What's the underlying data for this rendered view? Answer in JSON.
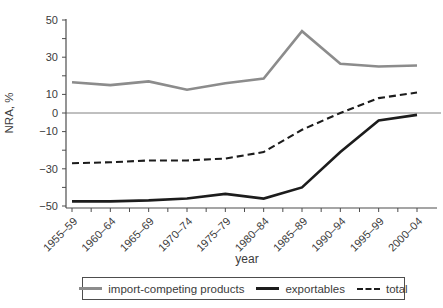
{
  "chart_data": {
    "type": "line",
    "title": "",
    "xlabel": "year",
    "ylabel": "NRA, %",
    "categories": [
      "1955–59",
      "1960–64",
      "1965–69",
      "1970–74",
      "1975–79",
      "1980–84",
      "1985–89",
      "1990–94",
      "1995–99",
      "2000–04"
    ],
    "series": [
      {
        "id": "import-competing",
        "name": "import-competing products",
        "values": [
          16.5,
          15,
          17,
          12.5,
          16,
          18.5,
          44,
          26.5,
          25,
          25.5
        ],
        "color": "#8c8c8c",
        "style": "solid",
        "width": 2.6
      },
      {
        "id": "exportables",
        "name": "exportables",
        "values": [
          -47.5,
          -47.5,
          -47,
          -46,
          -43.5,
          -46,
          -40,
          -21,
          -4,
          -1
        ],
        "color": "#1c1c1c",
        "style": "solid",
        "width": 2.6
      },
      {
        "id": "total",
        "name": "total",
        "values": [
          -27,
          -26.5,
          -25.5,
          -25.5,
          -24.5,
          -21,
          -9,
          0,
          8,
          11
        ],
        "color": "#1c1c1c",
        "style": "dashed",
        "width": 2.1
      }
    ],
    "ylim": [
      -50,
      50
    ],
    "yticks_labeled": [
      50,
      30,
      10,
      0,
      -10,
      -30,
      -50
    ],
    "ytick_minor_step": 10,
    "zero_line": true,
    "grid": false,
    "legend_position": "bottom"
  },
  "colors": {
    "axis": "#4d4d4d",
    "text": "#3b3b3b",
    "zero_line": "#808080",
    "background": "#ffffff",
    "legend_border": "#4d4d4d"
  }
}
